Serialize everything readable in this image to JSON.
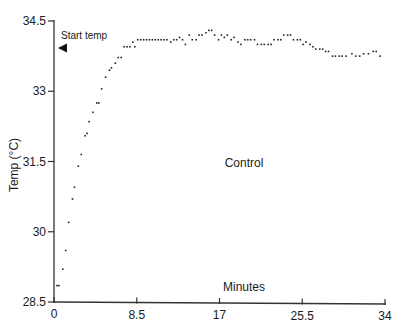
{
  "chart_data": {
    "type": "scatter",
    "title": "",
    "xlabel": "Minutes",
    "ylabel": "Temp (°C)",
    "series_label": "Control",
    "xlim": [
      0,
      34
    ],
    "ylim": [
      28.5,
      34.5
    ],
    "x_ticks": [
      0,
      8.5,
      17,
      25.5,
      34
    ],
    "x_tick_labels": [
      "0",
      "8.5",
      "17",
      "25.5",
      "34"
    ],
    "y_ticks": [
      28.5,
      30,
      31.5,
      33,
      34.5
    ],
    "y_tick_labels": [
      "28.5",
      "30",
      "31.5",
      "33",
      "34.5"
    ],
    "grid": false,
    "annotations": [
      {
        "text": "Start temp",
        "marker": "left-pointing triangle",
        "y": 33.92
      },
      {
        "text": "Control",
        "x": 19.5,
        "y": 31.5
      },
      {
        "text": "Minutes",
        "x": 19.5,
        "y": 28.85
      }
    ],
    "series": [
      {
        "name": "Control",
        "points": [
          [
            0.3,
            28.85
          ],
          [
            0.5,
            28.85
          ],
          [
            0.9,
            29.2
          ],
          [
            1.2,
            29.6
          ],
          [
            1.5,
            30.2
          ],
          [
            1.9,
            30.7
          ],
          [
            2.1,
            30.95
          ],
          [
            2.5,
            31.4
          ],
          [
            2.8,
            31.65
          ],
          [
            3.2,
            32.05
          ],
          [
            3.4,
            32.1
          ],
          [
            3.6,
            32.35
          ],
          [
            4.0,
            32.55
          ],
          [
            4.4,
            32.75
          ],
          [
            4.6,
            32.75
          ],
          [
            4.9,
            33.05
          ],
          [
            5.3,
            33.3
          ],
          [
            5.7,
            33.45
          ],
          [
            5.9,
            33.5
          ],
          [
            6.3,
            33.6
          ],
          [
            6.6,
            33.72
          ],
          [
            6.9,
            33.72
          ],
          [
            7.2,
            33.95
          ],
          [
            7.5,
            33.95
          ],
          [
            7.8,
            33.95
          ],
          [
            8.1,
            34.05
          ],
          [
            8.3,
            33.95
          ],
          [
            8.6,
            34.1
          ],
          [
            8.9,
            34.1
          ],
          [
            9.2,
            34.1
          ],
          [
            9.5,
            34.1
          ],
          [
            9.8,
            34.1
          ],
          [
            10.1,
            34.1
          ],
          [
            10.4,
            34.1
          ],
          [
            10.7,
            34.1
          ],
          [
            11.0,
            34.1
          ],
          [
            11.3,
            34.1
          ],
          [
            11.6,
            34.1
          ],
          [
            12.0,
            34.05
          ],
          [
            12.3,
            34.1
          ],
          [
            12.6,
            34.1
          ],
          [
            12.9,
            34.15
          ],
          [
            13.2,
            34.1
          ],
          [
            13.5,
            34.0
          ],
          [
            13.9,
            34.2
          ],
          [
            14.2,
            34.1
          ],
          [
            14.6,
            34.1
          ],
          [
            14.9,
            34.2
          ],
          [
            15.2,
            34.2
          ],
          [
            15.6,
            34.25
          ],
          [
            15.9,
            34.3
          ],
          [
            16.2,
            34.3
          ],
          [
            16.5,
            34.2
          ],
          [
            16.9,
            34.1
          ],
          [
            17.2,
            34.2
          ],
          [
            17.5,
            34.15
          ],
          [
            17.8,
            34.2
          ],
          [
            18.2,
            34.1
          ],
          [
            18.5,
            34.15
          ],
          [
            18.9,
            34.05
          ],
          [
            19.2,
            34.0
          ],
          [
            19.6,
            34.1
          ],
          [
            19.9,
            34.1
          ],
          [
            20.2,
            34.1
          ],
          [
            20.6,
            34.1
          ],
          [
            20.9,
            34.0
          ],
          [
            21.3,
            34.0
          ],
          [
            21.6,
            34.0
          ],
          [
            22.0,
            34.0
          ],
          [
            22.3,
            34.0
          ],
          [
            22.6,
            34.1
          ],
          [
            23.0,
            34.1
          ],
          [
            23.3,
            34.1
          ],
          [
            23.6,
            34.2
          ],
          [
            24.0,
            34.2
          ],
          [
            24.3,
            34.2
          ],
          [
            24.6,
            34.1
          ],
          [
            25.0,
            34.1
          ],
          [
            25.3,
            34.1
          ],
          [
            25.6,
            34.0
          ],
          [
            25.9,
            34.05
          ],
          [
            26.3,
            34.0
          ],
          [
            26.6,
            33.95
          ],
          [
            26.9,
            33.9
          ],
          [
            27.3,
            33.9
          ],
          [
            27.6,
            33.9
          ],
          [
            27.9,
            33.85
          ],
          [
            28.2,
            33.85
          ],
          [
            28.6,
            33.75
          ],
          [
            28.9,
            33.75
          ],
          [
            29.3,
            33.75
          ],
          [
            29.6,
            33.75
          ],
          [
            30.0,
            33.75
          ],
          [
            30.6,
            33.8
          ],
          [
            31.0,
            33.75
          ],
          [
            31.4,
            33.75
          ],
          [
            31.8,
            33.8
          ],
          [
            32.3,
            33.8
          ],
          [
            32.8,
            33.85
          ],
          [
            33.1,
            33.85
          ],
          [
            33.5,
            33.75
          ]
        ]
      }
    ]
  },
  "labels": {
    "start_temp": "Start temp",
    "control": "Control",
    "minutes": "Minutes",
    "ylabel": "Temp (°C)"
  }
}
